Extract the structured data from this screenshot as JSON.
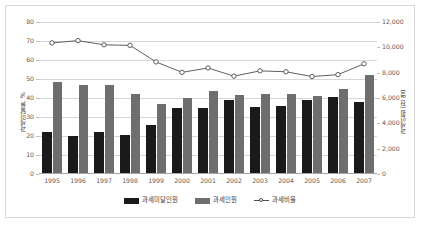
{
  "chart_data": {
    "type": "bar",
    "title": "",
    "subtitle": "",
    "xlabel": "",
    "ylabel": "과세미달률, %",
    "y2label": "과세인원 (천 명)",
    "grid": true,
    "legend_position": "bottom",
    "ylim": [
      0,
      80
    ],
    "y2lim": [
      0,
      12000
    ],
    "yticks": [
      "0",
      "10",
      "20",
      "30",
      "40",
      "50",
      "60",
      "70",
      "80"
    ],
    "y2ticks": [
      "0",
      "2,000",
      "4,000",
      "6,000",
      "8,000",
      "10,000",
      "12,000"
    ],
    "categories": [
      "1995",
      "1996",
      "1997",
      "1998",
      "1999",
      "2000",
      "2001",
      "2002",
      "2003",
      "2004",
      "2005",
      "2006",
      "2007"
    ],
    "series": [
      {
        "name": "과세미달인원",
        "kind": "bar",
        "color": "#1a1a1a",
        "axis": "right",
        "values": [
          3300,
          3000,
          3300,
          3075,
          3900,
          5250,
          5175,
          5850,
          5325,
          5400,
          5850,
          6075,
          5700
        ]
      },
      {
        "name": "과세인원",
        "kind": "bar",
        "color": "#6e6e6e",
        "axis": "right",
        "values": [
          7275,
          7050,
          7050,
          6300,
          5550,
          6000,
          6525,
          6225,
          6300,
          6300,
          6150,
          6675,
          7800
        ]
      },
      {
        "name": "과세비율",
        "kind": "line",
        "color": "#4d4d4d",
        "marker": "open-circle",
        "axis": "left",
        "values": [
          69.0,
          70.2,
          68.0,
          67.7,
          59.0,
          53.5,
          55.8,
          51.5,
          54.3,
          53.8,
          51.3,
          52.3,
          58.0
        ]
      }
    ]
  },
  "colors": {
    "bar_dark": "#1a1a1a",
    "bar_gray": "#6e6e6e",
    "line": "#4d4d4d",
    "gridline": "#d6d6d6",
    "axis": "#a6a6a6",
    "border": "#d9d9d9",
    "background": "#ffffff"
  }
}
